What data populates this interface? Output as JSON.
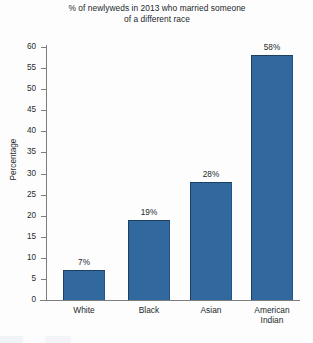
{
  "chart_data": {
    "type": "bar",
    "title": "% of newlyweds in 2013 who married someone of a different race",
    "title_line1": "% of newlyweds in 2013 who married someone",
    "title_line2": "of a different race",
    "xlabel": "",
    "ylabel": "Percentage",
    "categories": [
      "White",
      "Black",
      "Asian",
      "American Indian"
    ],
    "category_lines": [
      {
        "l1": "White",
        "l2": ""
      },
      {
        "l1": "Black",
        "l2": ""
      },
      {
        "l1": "Asian",
        "l2": ""
      },
      {
        "l1": "American",
        "l2": "Indian"
      }
    ],
    "values": [
      7,
      19,
      28,
      58
    ],
    "data_labels": [
      "7%",
      "19%",
      "28%",
      "58%"
    ],
    "ylim": [
      0,
      60
    ],
    "yticks": [
      0,
      5,
      10,
      15,
      20,
      25,
      30,
      35,
      40,
      45,
      50,
      55,
      60
    ],
    "ytick_labels": [
      "0",
      "5",
      "10",
      "15",
      "20",
      "25",
      "30",
      "35",
      "40",
      "45",
      "50",
      "55",
      "60"
    ],
    "grid": false,
    "legend": false,
    "bar_color": "#31699f",
    "bar_edge_color": "#1d3f62",
    "axis_color": "#7d7d7d",
    "text_color": "#23282c",
    "background_color": "#fdfdfd"
  }
}
